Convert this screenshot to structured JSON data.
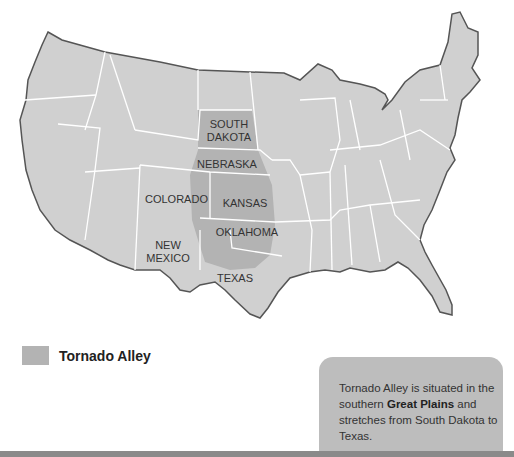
{
  "map": {
    "region": "Contiguous United States",
    "highlight_color": "#b3b3b3",
    "land_color": "#d0d0d0",
    "border_color": "#ffffff",
    "coast_color": "#555555",
    "state_labels": [
      {
        "id": "south-dakota",
        "line1": "SOUTH",
        "line2": "DAKOTA"
      },
      {
        "id": "nebraska",
        "line1": "NEBRASKA"
      },
      {
        "id": "colorado",
        "line1": "COLORADO"
      },
      {
        "id": "kansas",
        "line1": "KANSAS"
      },
      {
        "id": "new-mexico",
        "line1": "NEW",
        "line2": "MEXICO"
      },
      {
        "id": "oklahoma",
        "line1": "OKLAHOMA"
      },
      {
        "id": "texas",
        "line1": "TEXAS"
      }
    ]
  },
  "legend": {
    "label": "Tornado Alley"
  },
  "info_box": {
    "text_before": "Tornado Alley is situated in the southern ",
    "bold": "Great Plains",
    "text_after": " and stretches from South Dakota to Texas."
  }
}
